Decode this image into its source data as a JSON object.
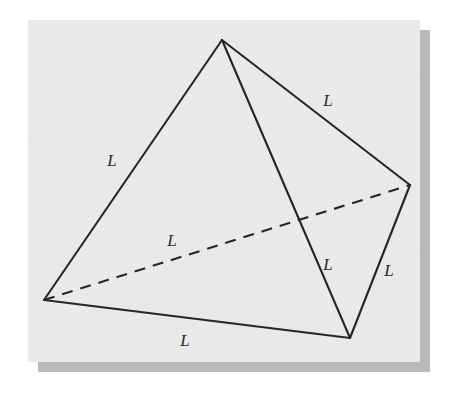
{
  "figure": {
    "canvas": {
      "width": 451,
      "height": 394,
      "background": "#ffffff"
    },
    "panel": {
      "x": 28,
      "y": 20,
      "width": 392,
      "height": 342,
      "fill": "#ebebeb",
      "shadow_color": "#b8b8b8",
      "shadow_offset": 10
    },
    "stroke_color": "#262626",
    "stroke_width": 2.1,
    "dash_pattern": "11 8",
    "vertices": [
      {
        "name": "apex",
        "x": 222,
        "y": 40
      },
      {
        "name": "left",
        "x": 44,
        "y": 300
      },
      {
        "name": "right",
        "x": 410,
        "y": 185
      },
      {
        "name": "bottom",
        "x": 350,
        "y": 338
      }
    ],
    "edges": [
      {
        "name": "apex-left",
        "from": "apex",
        "to": "left",
        "style": "solid"
      },
      {
        "name": "apex-right",
        "from": "apex",
        "to": "right",
        "style": "solid"
      },
      {
        "name": "apex-bottom",
        "from": "apex",
        "to": "bottom",
        "style": "solid"
      },
      {
        "name": "left-bottom",
        "from": "left",
        "to": "bottom",
        "style": "solid"
      },
      {
        "name": "right-bottom",
        "from": "right",
        "to": "bottom",
        "style": "solid"
      },
      {
        "name": "left-right",
        "from": "left",
        "to": "right",
        "style": "dashed"
      }
    ],
    "labels": [
      {
        "name": "label-upper-right-edge",
        "text": "L",
        "x": 328,
        "y": 106
      },
      {
        "name": "label-upper-left-edge",
        "text": "L",
        "x": 112,
        "y": 166
      },
      {
        "name": "label-hidden-edge",
        "text": "L",
        "x": 172,
        "y": 246
      },
      {
        "name": "label-interior-edge",
        "text": "L",
        "x": 328,
        "y": 270
      },
      {
        "name": "label-right-edge",
        "text": "L",
        "x": 389,
        "y": 276
      },
      {
        "name": "label-bottom-edge",
        "text": "L",
        "x": 185,
        "y": 346
      }
    ]
  }
}
